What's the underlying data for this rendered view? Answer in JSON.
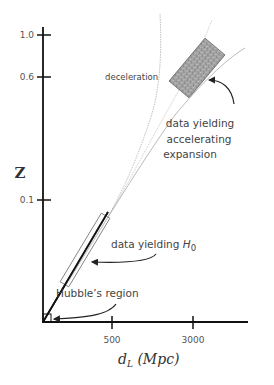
{
  "diagram": {
    "y_axis": {
      "title": "Z",
      "ticks": [
        "1.0",
        "0.6",
        "0.1"
      ]
    },
    "x_axis": {
      "title_main": "d",
      "title_sub": "L",
      "title_unit": " (Mpc)",
      "ticks": [
        "500",
        "3000"
      ]
    },
    "annotations": {
      "deceleration": "deceleration",
      "accelerating_line1": "data  yielding",
      "accelerating_line2": "accelerating",
      "accelerating_line3": "expansion",
      "h0_text": "data  yielding ",
      "h0_symbol": "H",
      "h0_sub": "0",
      "hubble_region": "Hubble’s  region"
    },
    "colors": {
      "axis": "#111111",
      "curve": "#9a9a9a",
      "data_box_fill": "#9c9c9c",
      "text": "#444444"
    }
  }
}
